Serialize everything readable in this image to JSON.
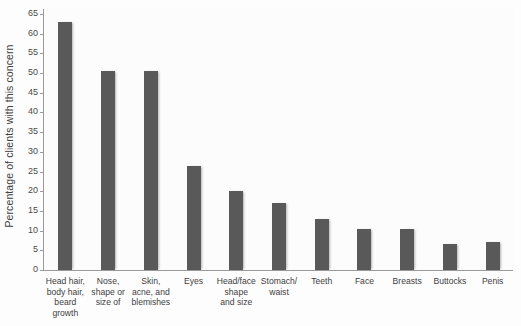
{
  "chart_data": {
    "type": "bar",
    "title": "",
    "subtitle": "",
    "xlabel": "",
    "ylabel": "Percentage of clients with this concern",
    "ylim": [
      0,
      65
    ],
    "ytick_step": 5,
    "yticks": [
      0,
      5,
      10,
      15,
      20,
      25,
      30,
      35,
      40,
      45,
      50,
      55,
      60,
      65
    ],
    "grid": false,
    "legend": null,
    "bar_color": "#595959",
    "background_color": "#fcfcfc",
    "axis_color": "#9a9a9a",
    "categories": [
      "Head hair, body hair, beard growth",
      "Nose, shape or size of",
      "Skin, acne, and blemishes",
      "Eyes",
      "Head/face shape and size",
      "Stomach/ waist",
      "Teeth",
      "Face",
      "Breasts",
      "Buttocks",
      "Penis"
    ],
    "category_lines": [
      [
        "Head hair,",
        "body hair,",
        "beard",
        "growth"
      ],
      [
        "Nose,",
        "shape or",
        "size of"
      ],
      [
        "Skin,",
        "acne, and",
        "blemishes"
      ],
      [
        "Eyes"
      ],
      [
        "Head/face",
        "shape",
        "and size"
      ],
      [
        "Stomach/",
        "waist"
      ],
      [
        "Teeth"
      ],
      [
        "Face"
      ],
      [
        "Breasts"
      ],
      [
        "Buttocks"
      ],
      [
        "Penis"
      ]
    ],
    "values": [
      63,
      50.5,
      50.5,
      26.5,
      20,
      17,
      13,
      10.5,
      10.5,
      6.5,
      7
    ]
  }
}
